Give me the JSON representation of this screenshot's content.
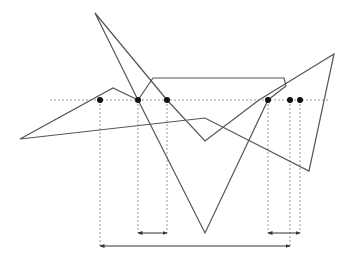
{
  "diagram": {
    "width": 347,
    "height": 260,
    "colors": {
      "stroke": "#555555",
      "dashed": "#999999",
      "point": "#111111",
      "background": "#ffffff"
    },
    "polygon_points": [
      [
        20,
        139
      ],
      [
        205,
        118
      ],
      [
        309,
        171
      ],
      [
        334,
        54
      ],
      [
        259,
        100
      ],
      [
        205,
        141
      ],
      [
        167,
        100
      ],
      [
        95,
        13
      ],
      [
        138,
        100
      ],
      [
        205,
        233
      ],
      [
        268,
        100
      ],
      [
        286,
        86
      ],
      [
        284,
        78
      ],
      [
        153,
        78
      ],
      [
        138,
        100
      ],
      [
        113,
        88
      ]
    ],
    "scan_line": {
      "y": 100,
      "x1": 50,
      "x2": 330
    },
    "intersections": [
      {
        "x": 100,
        "y": 100
      },
      {
        "x": 138,
        "y": 100
      },
      {
        "x": 167,
        "y": 100
      },
      {
        "x": 268,
        "y": 100
      },
      {
        "x": 290,
        "y": 100
      },
      {
        "x": 300,
        "y": 100
      }
    ],
    "spans": [
      {
        "x1": 138,
        "x2": 167,
        "y": 233
      },
      {
        "x1": 268,
        "x2": 300,
        "y": 233
      },
      {
        "x1": 100,
        "x2": 290,
        "y": 246
      }
    ]
  }
}
